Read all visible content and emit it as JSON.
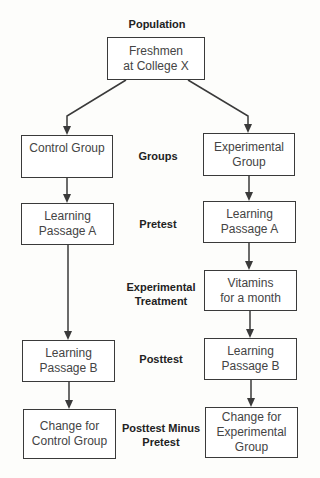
{
  "diagram": {
    "stage_labels": {
      "population": "Population",
      "groups": "Groups",
      "pretest": "Pretest",
      "treatment": "Experimental\nTreatment",
      "posttest": "Posttest",
      "difference": "Posttest Minus\nPretest"
    },
    "population_box": "Freshmen\nat College X",
    "control": {
      "group": "Control  Group",
      "pretest": "Learning\nPassage A",
      "posttest": "Learning\nPassage B",
      "change": "Change for\nControl Group"
    },
    "experimental": {
      "group": "Experimental\nGroup",
      "pretest": "Learning\nPassage A",
      "treatment": "Vitamins\nfor a month",
      "posttest": "Learning\nPassage B",
      "change": "Change for\nExperimental\nGroup"
    },
    "colors": {
      "line": "#3a3a3a",
      "text": "#444444"
    }
  }
}
